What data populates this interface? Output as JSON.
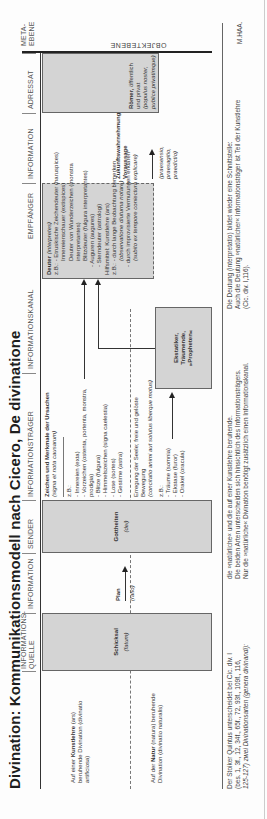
{
  "title": "Divination: Kommunikationsmodell nach Cicero, De divinatione",
  "columns": {
    "quelle": "INFORMATIONS-\nQUELLE",
    "information1": "INFORMATION",
    "sender": "SENDER",
    "traeger": "INFORMATIONSTRÄGER",
    "kanal": "INFORMATIONSKANAL",
    "empfaenger": "EMPFÄNGER",
    "information2": "INFORMATION",
    "adressat": "ADRESSAT",
    "metaebene": "META-\nEBENE"
  },
  "objektebene": "OBJEKTEBENE",
  "side_labels": {
    "artificiosa": {
      "pre": "Auf einer",
      "bold": "Kunstlehre",
      "post": "(ars) beruhende Divination (divinatio artificiosa)"
    },
    "naturalis": {
      "pre": "Auf der",
      "bold": "Natur",
      "post": "(natura) beruhende Divination (divinatio naturalis)"
    }
  },
  "quelle_box": {
    "label": "Schicksal",
    "latin": "(fatum)"
  },
  "information1": {
    "label": "Plan",
    "latin": "(ratio)"
  },
  "sender_box": {
    "label": "Gottheiten",
    "latin": "(dei)"
  },
  "traeger": {
    "heading": "Zeichen und Merkmale der Ursachen",
    "heading_latin": "(signa et nota causarum)",
    "zb": "z.B.:",
    "items_artificiosa": [
      "- Innereien (exta)",
      "- Vorzeichen (ostenta, portenta, monstra, prodigia)",
      "- Blitze (fulgura)",
      "- Himmelszeichen (signa caelestia)",
      "- Lose (sortes)",
      "- Gestirne (astra)"
    ],
    "natural_heading": "Erregung der Seele; freie und gelöste Bewegung",
    "natural_latin": "(concitatio animi aut solutus liberque motus)",
    "zb2": "z.B.:",
    "items_naturalis": [
      "- Träume (somnia)",
      "- Ekstase (furor)",
      "- Orakel (oracula)"
    ]
  },
  "kanal_box": {
    "lines": [
      "Ekstatiker,",
      "Träumende,",
      "»Propheten«"
    ]
  },
  "empfaenger": {
    "heading": "Deuter",
    "heading_latin": "(interpretes)",
    "lines": [
      "z.B.: - Etruskische Zeichendeuter (haruspices)",
      "Innereienschauer (extispices)",
      "Deuter von Wunderzeichen (monstra interpretantes)",
      "Blitzdeuter (fulgura interpretantes)",
      "- Auguren (augures)",
      "- Sterndeuter (astrologi)",
      "Hilfsmittel: Kunstlehre (ars)",
      "z.B.: - durch lange Beobachtung bemerken",
      "(observatione diuturna notare)",
      "- durch improvisierte Vermutungen erklären",
      "(subito ex tempore coniectura explicare)"
    ]
  },
  "information2": {
    "label": "Zukunftswahrnehmung/ Voraussage",
    "latin": "(praesensio, praesagitio, praedictio)"
  },
  "adressat_box": {
    "label": "Römer,",
    "rest": "öffentlich und privat",
    "latin": "(populus noster, publice privatimque)"
  },
  "footer": {
    "col1": [
      "Der Stoiker Quintus unterscheidet bei Cic. div. I",
      "(bes. 1, 3f., 12, 34f., 65f., 72, 93f., 109f., 116,",
      "125-127) zwei Divinationsarten (genera divinandi):"
    ],
    "col2": [
      "die »natürliche« und die auf einer Kunstlehre beruhende.",
      "Die beiden Arten unterscheiden sich hinsichtlich des Informationsträgers.",
      "Nur die »natürliche« Divination benötigt zusätzlich einen Informationskanal."
    ],
    "col3": [
      "Die Deutung (interpretatio) bildet wieder eine Schnittstelle:",
      "Auch die Deutung »natürlicher« Informationsträger ist Teil der Kunstlehre",
      "(Cic. div. I,116)."
    ],
    "author": "M.HAA."
  }
}
